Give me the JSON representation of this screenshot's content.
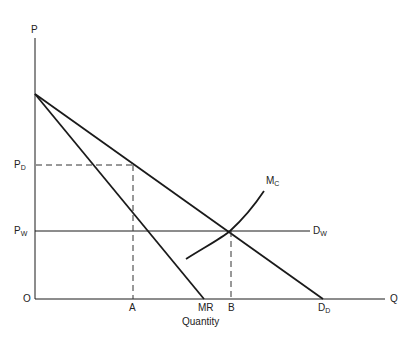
{
  "diagram": {
    "type": "economics-supply-demand",
    "axes": {
      "y_label": "P",
      "x_end_label": "Q",
      "origin_label": "O",
      "x_title": "Quantity"
    },
    "price_levels": [
      {
        "id": "pd",
        "label": "P",
        "subscript": "D"
      },
      {
        "id": "pw",
        "label": "P",
        "subscript": "W"
      }
    ],
    "quantity_points": [
      {
        "id": "a",
        "label": "A"
      },
      {
        "id": "mr",
        "label": "MR"
      },
      {
        "id": "b",
        "label": "B"
      },
      {
        "id": "dd",
        "label": "D",
        "subscript": "D"
      }
    ],
    "curves": {
      "mc": {
        "label": "M",
        "subscript": "C"
      },
      "dw": {
        "label": "D",
        "subscript": "W"
      },
      "dd": {
        "label": "D",
        "subscript": "D"
      },
      "mr": {
        "label": "MR"
      }
    },
    "colors": {
      "line": "#1a1a1a",
      "background": "#ffffff"
    }
  }
}
